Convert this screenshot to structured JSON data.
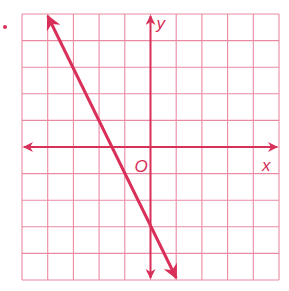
{
  "chart_data": {
    "type": "line",
    "title": "",
    "xlabel": "x",
    "ylabel": "y",
    "origin_label": "O",
    "xlim": [
      -5,
      5
    ],
    "ylim": [
      -5,
      5
    ],
    "grid": true,
    "grid_step": 1,
    "series": [
      {
        "name": "line",
        "equation": "y = -2x - 3",
        "slope": -2,
        "y_intercept": -3,
        "x_intercept": -1.5,
        "x": [
          -4,
          1
        ],
        "y": [
          5,
          -5
        ],
        "arrows_both_ends": true
      }
    ]
  },
  "labels": {
    "x_axis": "x",
    "y_axis": "y",
    "origin": "O"
  },
  "colors": {
    "ink": "#d9305a",
    "grid": "#e98aa2",
    "background": "#ffffff"
  },
  "geometry": {
    "left": 22,
    "top": 14,
    "cell_w": 25.7,
    "cell_h": 26.6,
    "cols": 10,
    "rows": 10
  }
}
